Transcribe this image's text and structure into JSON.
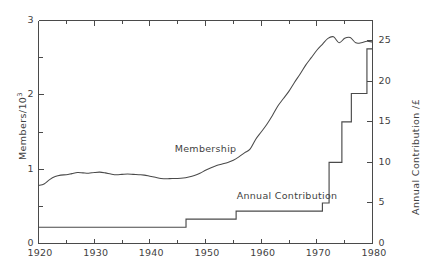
{
  "chart_data": {
    "type": "line",
    "title": "",
    "xlabel": "",
    "xlim": [
      1920,
      1980
    ],
    "xticks": [
      1920,
      1930,
      1940,
      1950,
      1960,
      1970,
      1980
    ],
    "xtick_labels": [
      "1920",
      "1930",
      "1940",
      "1950",
      "1960",
      "1970",
      "1980"
    ],
    "xminor_ticks": [
      1925,
      1935,
      1945,
      1955,
      1965,
      1975
    ],
    "grid": false,
    "legend_position": "inline-annotations",
    "axes": [
      {
        "id": "left",
        "label_plain": "Members/10^3",
        "label_prefix": "Members/10",
        "label_exponent": "3",
        "ylim": [
          0,
          3
        ],
        "yticks": [
          0,
          1,
          2,
          3
        ],
        "ytick_labels": [
          "0",
          "1",
          "2",
          "3"
        ],
        "yminor_ticks": [
          0.5,
          1.5,
          2.5
        ]
      },
      {
        "id": "right",
        "label_plain": "Annual  Contribution /£",
        "ylim": [
          0,
          27.5
        ],
        "yticks": [
          0,
          5,
          10,
          15,
          20,
          25
        ],
        "ytick_labels": [
          "0",
          "5",
          "10",
          "15",
          "20",
          "25"
        ],
        "yminor_ticks": []
      }
    ],
    "series": [
      {
        "name": "Membership",
        "axis": "left",
        "style": "smooth-line",
        "annotation": "Membership",
        "annotation_xy": [
          1949.5,
          1.27
        ],
        "units": "thousands of members",
        "x": [
          1920,
          1921,
          1922,
          1923,
          1924,
          1925,
          1926,
          1927,
          1928,
          1929,
          1930,
          1931,
          1932,
          1933,
          1934,
          1935,
          1936,
          1937,
          1938,
          1939,
          1940,
          1941,
          1942,
          1943,
          1944,
          1945,
          1946,
          1947,
          1948,
          1949,
          1950,
          1951,
          1952,
          1953,
          1954,
          1955,
          1956,
          1957,
          1958,
          1959,
          1960,
          1961,
          1962,
          1963,
          1964,
          1965,
          1966,
          1967,
          1968,
          1969,
          1970,
          1971,
          1972,
          1973,
          1974,
          1975,
          1976,
          1977,
          1978,
          1979,
          1980
        ],
        "values": [
          0.78,
          0.8,
          0.86,
          0.9,
          0.92,
          0.925,
          0.94,
          0.955,
          0.95,
          0.945,
          0.955,
          0.96,
          0.95,
          0.935,
          0.925,
          0.93,
          0.935,
          0.93,
          0.925,
          0.92,
          0.905,
          0.89,
          0.875,
          0.87,
          0.875,
          0.875,
          0.88,
          0.895,
          0.915,
          0.945,
          0.985,
          1.02,
          1.05,
          1.07,
          1.09,
          1.12,
          1.165,
          1.22,
          1.27,
          1.4,
          1.5,
          1.6,
          1.72,
          1.85,
          1.95,
          2.05,
          2.17,
          2.28,
          2.4,
          2.5,
          2.6,
          2.68,
          2.76,
          2.78,
          2.7,
          2.76,
          2.77,
          2.7,
          2.7,
          2.72,
          2.71
        ]
      },
      {
        "name": "Annual Contribution",
        "axis": "right",
        "style": "step-post",
        "annotation": "Annual Contribution",
        "annotation_xy": [
          1963.5,
          5.9
        ],
        "units": "pounds sterling",
        "steps": [
          {
            "from_year": 1920.0,
            "value": 2.0
          },
          {
            "from_year": 1946.5,
            "value": 3.0
          },
          {
            "from_year": 1955.5,
            "value": 4.0
          },
          {
            "from_year": 1971.0,
            "value": 5.0
          },
          {
            "from_year": 1972.2,
            "value": 10.0
          },
          {
            "from_year": 1974.5,
            "value": 15.0
          },
          {
            "from_year": 1976.2,
            "value": 18.5
          },
          {
            "from_year": 1979.0,
            "value": 24.0
          },
          {
            "from_year": 1980.0,
            "value": 24.0
          }
        ]
      }
    ],
    "colors": {
      "axis": "#4a4a4a",
      "membership_line": "#4a4a4a",
      "contribution_line": "#4a4a4a",
      "background": "#ffffff",
      "text": "#3f3f3f"
    }
  }
}
